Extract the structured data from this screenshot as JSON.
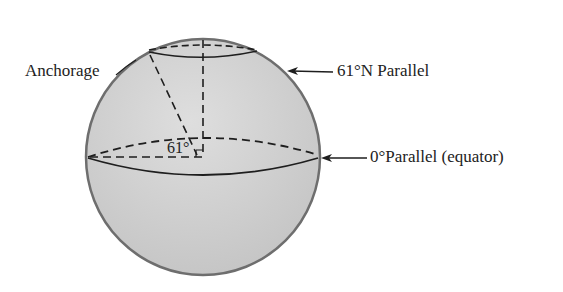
{
  "diagram": {
    "labels": {
      "anchorage": "Anchorage",
      "parallel_61": "61°N Parallel",
      "equator": "0°Parallel (equator)",
      "angle": "61°"
    },
    "colors": {
      "sphere_fill": "#d2d2d2",
      "sphere_stroke": "#6e6e6e",
      "line": "#1e1e1e",
      "text": "#222222"
    }
  }
}
